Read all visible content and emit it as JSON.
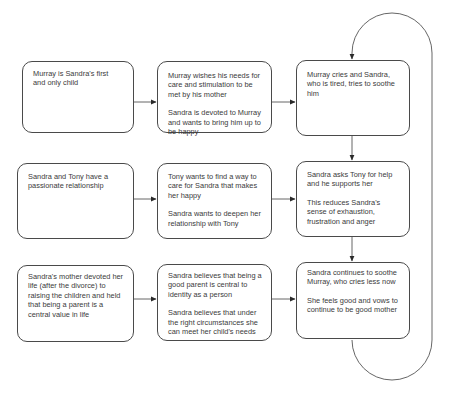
{
  "diagram": {
    "type": "flowchart",
    "layout": "3 rows x 3 columns with feedback loop on right column",
    "colors": {
      "stroke": "#4a4a4a",
      "text": "#3a3a3a",
      "background": "#ffffff"
    },
    "nodes": {
      "r1c1": {
        "paragraphs": [
          "Murray  is Sandra's first\n and only child"
        ]
      },
      "r1c2": {
        "paragraphs": [
          "Murray wishes his needs for care and stimulation to be met by his mother",
          "Sandra is devoted to Murray and wants to bring him up to be happy"
        ]
      },
      "r1c3": {
        "paragraphs": [
          "Murray cries and Sandra, who is tired,  tries to soothe him"
        ]
      },
      "r2c1": {
        "paragraphs": [
          "Sandra and Tony have a passionate relationship"
        ]
      },
      "r2c2": {
        "paragraphs": [
          "Tony  wants to find a way to care for Sandra that makes her happy",
          "Sandra wants to deepen her relationship with Tony"
        ]
      },
      "r2c3": {
        "paragraphs": [
          "Sandra asks Tony for help and he supports her",
          "This reduces Sandra's sense of exhaustion, frustration and anger"
        ]
      },
      "r3c1": {
        "paragraphs": [
          "Sandra's mother devoted her life (after the divorce) to raising the children and held that being a parent is a central value in life"
        ]
      },
      "r3c2": {
        "paragraphs": [
          "Sandra believes that being a good parent is central to identity as a person",
          "Sandra  believes that under the right circumstances she can meet her child's needs"
        ]
      },
      "r3c3": {
        "paragraphs": [
          "Sandra continues to soothe Murray, who cries less now",
          "She feels good and vows to continue to be good mother"
        ]
      }
    },
    "edges": [
      {
        "from": "r1c1",
        "to": "r1c2"
      },
      {
        "from": "r1c2",
        "to": "r1c3"
      },
      {
        "from": "r2c1",
        "to": "r2c2"
      },
      {
        "from": "r2c2",
        "to": "r2c3"
      },
      {
        "from": "r3c1",
        "to": "r3c2"
      },
      {
        "from": "r3c2",
        "to": "r3c3"
      },
      {
        "from": "r1c3",
        "to": "r2c3"
      },
      {
        "from": "r2c3",
        "to": "r3c3"
      },
      {
        "from": "r3c3",
        "to": "r1c3",
        "style": "loop-right"
      }
    ]
  },
  "text": {
    "r1c1_p1": "Murray  is Sandra's first",
    "r1c1_p1b": " and only child",
    "r1c2_p1": "Murray wishes his needs for care and stimulation to be met by his mother",
    "r1c2_p2": "Sandra is devoted to Murray and wants to bring him up to be happy",
    "r1c3_p1": "Murray cries and Sandra, who is tired,  tries to soothe him",
    "r2c1_p1": "Sandra and Tony have a passionate relationship",
    "r2c2_p1": "Tony  wants to find a way to care for Sandra that makes her happy",
    "r2c2_p2": "Sandra wants to deepen her relationship with Tony",
    "r2c3_p1": "Sandra asks Tony for help and he supports her",
    "r2c3_p2": "This reduces Sandra's sense of exhaustion, frustration and anger",
    "r3c1_p1": "Sandra's mother devoted her life (after the divorce) to raising the children and held that being a parent is a central value in life",
    "r3c2_p1": "Sandra believes that being a good parent is central to identity as a person",
    "r3c2_p2": "Sandra  believes that under the right circumstances she can meet her child's needs",
    "r3c3_p1": "Sandra continues to soothe Murray, who cries less now",
    "r3c3_p2": "She feels good and vows to continue to be good mother"
  }
}
